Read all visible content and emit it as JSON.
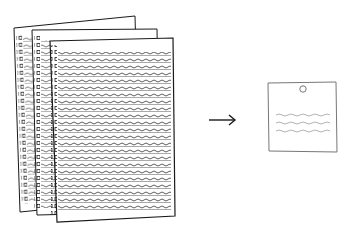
{
  "illustration": {
    "description": "Stack of dense handwritten pages summarized into a single short note",
    "source_stack": {
      "page_count": 3,
      "icon": "document-stack-icon"
    },
    "arrow": {
      "icon": "arrow-right-icon"
    },
    "result_note": {
      "icon": "pinned-note-icon",
      "line_count": 3
    }
  },
  "colors": {
    "ink": "#1a1a1a",
    "paper": "#ffffff",
    "note_border": "#777777",
    "note_lines": "#aaaaaa"
  }
}
